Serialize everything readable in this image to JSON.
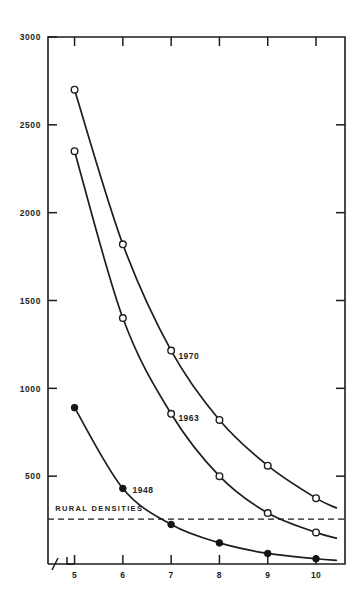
{
  "chart_data": {
    "type": "line",
    "title": "",
    "subtitle": "",
    "xlabel": "",
    "ylabel": "",
    "x": [
      5,
      6,
      7,
      8,
      9,
      10
    ],
    "xlim": [
      4.45,
      10.6
    ],
    "ylim": [
      0,
      3000
    ],
    "grid": false,
    "legend_position": "inline-annotations",
    "y_ticks": [
      500,
      1000,
      1500,
      2000,
      2500,
      3000
    ],
    "y_tick_labels": [
      "500",
      "1000",
      "1500",
      "2000",
      "2500",
      "3000"
    ],
    "x_ticks": [
      5,
      6,
      7,
      8,
      9,
      10
    ],
    "x_tick_labels": [
      "5",
      "6",
      "7",
      "8",
      "9",
      "10"
    ],
    "axis_break": true,
    "series": [
      {
        "name": "1970",
        "marker": "open-circle",
        "label": "1970",
        "x": [
          5,
          6,
          7,
          8,
          9,
          10
        ],
        "values": [
          2700,
          1820,
          1215,
          820,
          560,
          375
        ]
      },
      {
        "name": "1963",
        "marker": "open-circle",
        "label": "1963",
        "x": [
          5,
          6,
          7,
          8,
          9,
          10
        ],
        "values": [
          2350,
          1400,
          855,
          500,
          290,
          180
        ]
      },
      {
        "name": "1948",
        "marker": "filled-circle",
        "label": "1948",
        "x": [
          5,
          6,
          7,
          8,
          9,
          10
        ],
        "values": [
          890,
          430,
          225,
          120,
          60,
          30
        ]
      }
    ],
    "annotations": [
      {
        "text": "1970",
        "x": 7.15,
        "y": 1185
      },
      {
        "text": "1963",
        "x": 7.15,
        "y": 830
      },
      {
        "text": "1948",
        "x": 6.2,
        "y": 420
      },
      {
        "text": "RURAL DENSITIES",
        "x": 4.6,
        "y": 300
      }
    ],
    "reference_line": {
      "label": "RURAL DENSITIES",
      "value": 255,
      "style": "dashed",
      "orientation": "horizontal"
    },
    "colors": {
      "axis": "#1d1d1d",
      "curve": "#1d1d1d",
      "marker_fill_open": "#ffffff",
      "marker_fill_closed": "#141414",
      "background": "#ffffff"
    }
  }
}
